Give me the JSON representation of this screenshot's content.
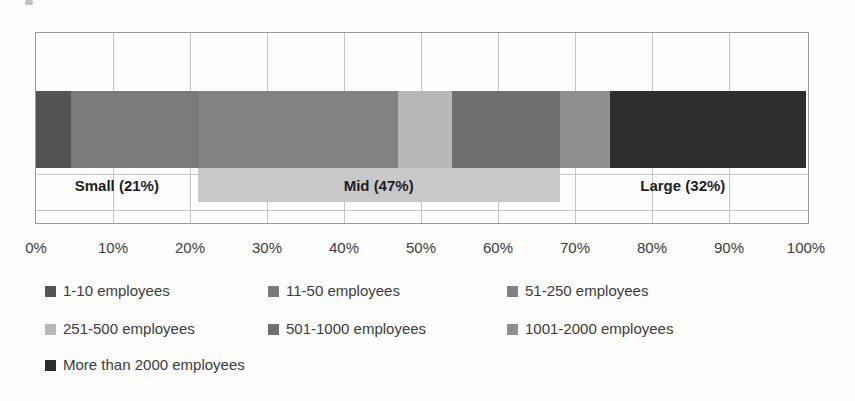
{
  "chart_data": {
    "type": "bar",
    "subtype": "horizontal-100pct-stacked",
    "title": "",
    "xlabel": "",
    "ylabel": "",
    "series": [
      {
        "name": "1-10 employees",
        "value": 4.5,
        "color": "#545454"
      },
      {
        "name": "11-50 employees",
        "value": 16.5,
        "color": "#7a7a7a"
      },
      {
        "name": "51-250 employees",
        "value": 26,
        "color": "#828282"
      },
      {
        "name": "251-500 employees",
        "value": 7,
        "color": "#b7b7b7"
      },
      {
        "name": "501-1000 employees",
        "value": 14,
        "color": "#6f6f6f"
      },
      {
        "name": "1001-2000 employees",
        "value": 6.5,
        "color": "#8f8f8f"
      },
      {
        "name": "More than 2000 employees",
        "value": 25.5,
        "color": "#2e2e2e"
      }
    ],
    "groups": [
      {
        "label": "Small (21%)",
        "start_pct": 0,
        "end_pct": 21,
        "band": false
      },
      {
        "label": "Mid (47%)",
        "start_pct": 21,
        "end_pct": 68,
        "band": true,
        "band_color": "#c8c8c8"
      },
      {
        "label": "Large (32%)",
        "start_pct": 68,
        "end_pct": 100,
        "band": false
      }
    ],
    "x_axis": {
      "min": 0,
      "max": 100,
      "ticks": [
        "0%",
        "10%",
        "20%",
        "30%",
        "40%",
        "50%",
        "60%",
        "70%",
        "80%",
        "90%",
        "100%"
      ]
    },
    "grid": true,
    "legend_position": "bottom",
    "colors": {
      "gridline": "#c6c6c4",
      "plot_border": "#9b9b9b",
      "axis_text": "#3c3c3c",
      "group_label_text": "#1e1e1e"
    }
  }
}
